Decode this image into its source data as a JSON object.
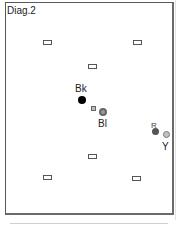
{
  "diagram": {
    "title": "Diag.2",
    "colors": {
      "frame": "#5a5a5a",
      "black_dot": "#000000",
      "bl_dot": "#8a8a8a",
      "r_dot": "#555555",
      "y_dot": "#b5b5b5"
    },
    "rectangles": [
      {
        "id": "rect-top-left",
        "x": 44,
        "y": 41
      },
      {
        "id": "rect-top-right",
        "x": 134,
        "y": 41
      },
      {
        "id": "rect-upper-center",
        "x": 89,
        "y": 65
      },
      {
        "id": "rect-lower-center",
        "x": 89,
        "y": 155
      },
      {
        "id": "rect-bottom-left",
        "x": 44,
        "y": 176
      },
      {
        "id": "rect-bottom-right",
        "x": 133,
        "y": 177
      }
    ],
    "points": [
      {
        "label": "Bk",
        "fill": "black",
        "cx": 82,
        "cy": 100
      },
      {
        "label": "Bl",
        "fill": "grey",
        "cx": 103,
        "cy": 112
      },
      {
        "label": "R",
        "fill": "dark grey",
        "cx": 156,
        "cy": 132
      },
      {
        "label": "Y",
        "fill": "light grey",
        "cx": 167,
        "cy": 135
      }
    ],
    "labels": {
      "bk": "Bk",
      "bl": "Bl",
      "r": "R",
      "y": "Y"
    }
  }
}
